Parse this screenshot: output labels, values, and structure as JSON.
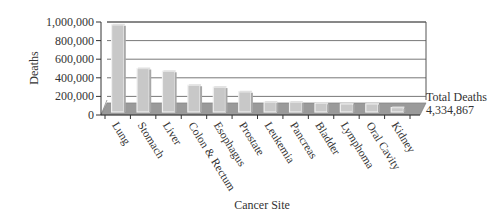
{
  "chart_data": {
    "type": "bar",
    "title": "",
    "xlabel": "Cancer Site",
    "ylabel": "Deaths",
    "ylim": [
      0,
      1000000
    ],
    "yticks": [
      0,
      200000,
      400000,
      600000,
      800000,
      1000000
    ],
    "ytick_labels": [
      "0",
      "200,000",
      "400,000",
      "600,000",
      "800,000",
      "1,000,000"
    ],
    "grid": true,
    "categories": [
      "Lung",
      "Stomach",
      "Liver",
      "Colon & Rectum",
      "Esophagus",
      "Prostate",
      "Leukemia",
      "Pancreas",
      "Bladder",
      "Lymphoma",
      "Oral Cavity",
      "Kidney"
    ],
    "values": [
      970000,
      500000,
      470000,
      320000,
      300000,
      250000,
      140000,
      140000,
      125000,
      120000,
      120000,
      80000
    ],
    "annotations": [
      {
        "text": "Total Deaths",
        "position": "right"
      },
      {
        "text": "4,334,867",
        "position": "right"
      }
    ],
    "total_deaths_band_value": 130000,
    "colors": {
      "bar": "#c8c8c8",
      "bar_edge": "#f0f0f0",
      "floor": "#9a9a9a",
      "grid": "#555555"
    }
  },
  "labels": {
    "xlabel": "Cancer Site",
    "ylabel": "Deaths",
    "total_title": "Total Deaths",
    "total_value": "4,334,867"
  }
}
